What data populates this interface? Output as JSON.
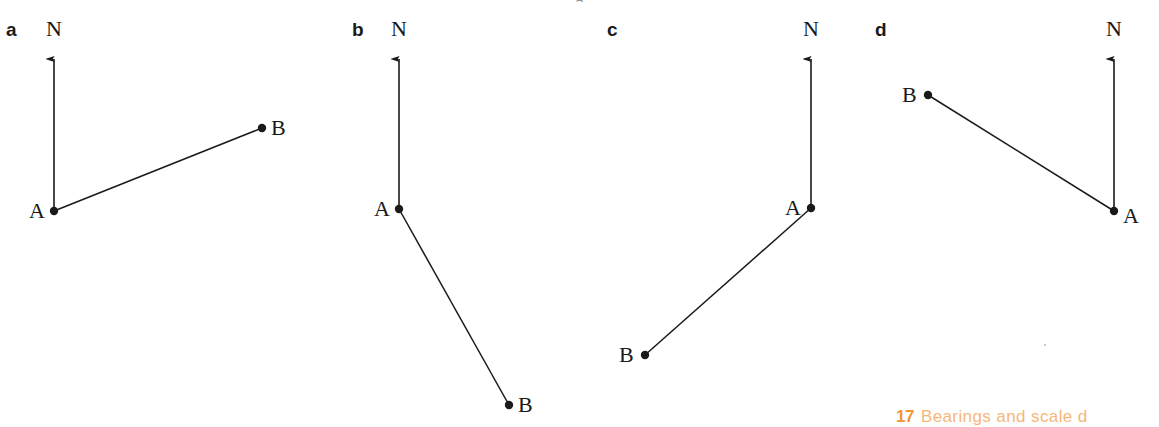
{
  "page": {
    "width": 1159,
    "height": 427,
    "background": "#ffffff",
    "ink_color": "#1a1a1a",
    "top_clipped_text": "g"
  },
  "footer": {
    "chapter_number": "17",
    "chapter_title": "Bearings and scale d",
    "number_color": "#f0952f",
    "title_color": "#f5b778"
  },
  "chart_data": {
    "type": "scatter",
    "title": "",
    "xlabel": "",
    "ylabel": "",
    "panels": [
      {
        "id": "a",
        "letter": "a",
        "letter_pos": {
          "x": 6,
          "y": 20
        },
        "north_label": "N",
        "north_label_pos": {
          "x": 46,
          "y": 18
        },
        "north_arrow": {
          "x1": 54,
          "y1": 211,
          "x2": 54,
          "y2": 50
        },
        "line": {
          "x1": 54,
          "y1": 211,
          "x2": 262,
          "y2": 128
        },
        "points": [
          {
            "label": "A",
            "x": 54,
            "y": 211,
            "label_pos": {
              "x": 29,
              "y": 200
            }
          },
          {
            "label": "B",
            "x": 262,
            "y": 128,
            "label_pos": {
              "x": 271,
              "y": 117
            }
          }
        ]
      },
      {
        "id": "b",
        "letter": "b",
        "letter_pos": {
          "x": 352,
          "y": 20
        },
        "north_label": "N",
        "north_label_pos": {
          "x": 391,
          "y": 18
        },
        "north_arrow": {
          "x1": 399,
          "y1": 209,
          "x2": 399,
          "y2": 50
        },
        "line": {
          "x1": 399,
          "y1": 209,
          "x2": 509,
          "y2": 405
        },
        "points": [
          {
            "label": "A",
            "x": 399,
            "y": 209,
            "label_pos": {
              "x": 374,
              "y": 198
            }
          },
          {
            "label": "B",
            "x": 509,
            "y": 405,
            "label_pos": {
              "x": 518,
              "y": 394
            }
          }
        ]
      },
      {
        "id": "c",
        "letter": "c",
        "letter_pos": {
          "x": 607,
          "y": 20
        },
        "north_label": "N",
        "north_label_pos": {
          "x": 803,
          "y": 18
        },
        "north_arrow": {
          "x1": 811,
          "y1": 208,
          "x2": 811,
          "y2": 50
        },
        "line": {
          "x1": 811,
          "y1": 208,
          "x2": 645,
          "y2": 355
        },
        "points": [
          {
            "label": "A",
            "x": 811,
            "y": 208,
            "label_pos": {
              "x": 785,
              "y": 197
            }
          },
          {
            "label": "B",
            "x": 645,
            "y": 355,
            "label_pos": {
              "x": 619,
              "y": 344
            }
          }
        ]
      },
      {
        "id": "d",
        "letter": "d",
        "letter_pos": {
          "x": 875,
          "y": 20
        },
        "north_label": "N",
        "north_label_pos": {
          "x": 1106,
          "y": 18
        },
        "north_arrow": {
          "x1": 1114,
          "y1": 211,
          "x2": 1114,
          "y2": 50
        },
        "line": {
          "x1": 1114,
          "y1": 211,
          "x2": 928,
          "y2": 95
        },
        "points": [
          {
            "label": "A",
            "x": 1114,
            "y": 211,
            "label_pos": {
              "x": 1123,
              "y": 205
            }
          },
          {
            "label": "B",
            "x": 928,
            "y": 95,
            "label_pos": {
              "x": 902,
              "y": 84
            }
          }
        ]
      }
    ]
  }
}
